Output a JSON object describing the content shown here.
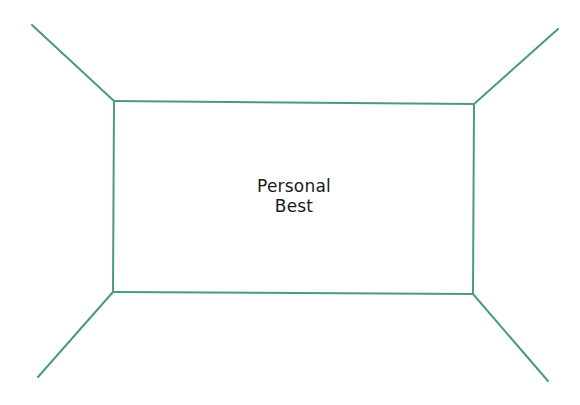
{
  "diagram": {
    "title_line1": "Personal",
    "title_line2": "Best",
    "line_color": "#4a9a82",
    "inner_rect": {
      "x1": 114,
      "y1": 101,
      "x2": 474,
      "y2": 294
    },
    "corner_lines": [
      {
        "name": "top-left",
        "x1": 32,
        "y1": 25,
        "x2": 114,
        "y2": 101
      },
      {
        "name": "top-right",
        "x1": 558,
        "y1": 29,
        "x2": 474,
        "y2": 104
      },
      {
        "name": "bottom-left",
        "x1": 38,
        "y1": 377,
        "x2": 113,
        "y2": 292
      },
      {
        "name": "bottom-right",
        "x1": 548,
        "y1": 381,
        "x2": 473,
        "y2": 294
      }
    ]
  }
}
